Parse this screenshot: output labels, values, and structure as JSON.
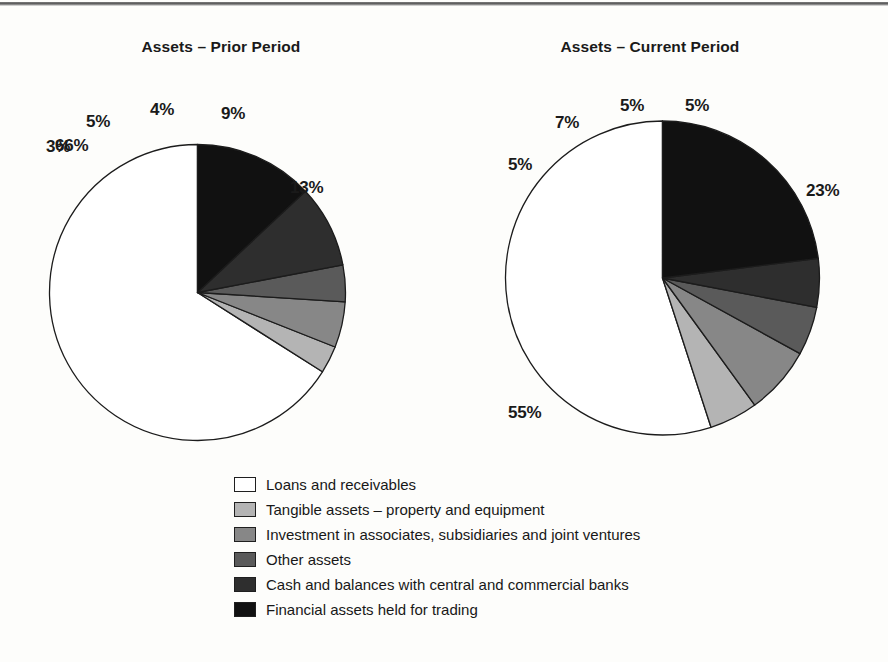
{
  "figure": {
    "background": "#fdfdfb",
    "ink": "#1a1a1a"
  },
  "charts": {
    "left": {
      "title": "Assets – Prior Period"
    },
    "right": {
      "title": "Assets – Current Period"
    }
  },
  "legend": {
    "items": [
      {
        "label": "Loans and receivables",
        "color": "#ffffff",
        "swatch_name": "legend-swatch-loans-and-receivables"
      },
      {
        "label": "Tangible assets – property and equipment",
        "color": "#b4b4b4",
        "swatch_name": "legend-swatch-tangible-assets"
      },
      {
        "label": "Investment in associates, subsidiaries and joint ventures",
        "color": "#878787",
        "swatch_name": "legend-swatch-investment-in-associates"
      },
      {
        "label": "Other assets",
        "color": "#5a5a5a",
        "swatch_name": "legend-swatch-other-assets"
      },
      {
        "label": "Cash and balances with central and commercial banks",
        "color": "#2e2e2e",
        "swatch_name": "legend-swatch-cash-and-balances"
      },
      {
        "label": "Financial assets held for trading",
        "color": "#111111",
        "swatch_name": "legend-swatch-financial-assets-held-for-trading"
      }
    ]
  },
  "chart_data": [
    {
      "type": "pie",
      "title": "Assets – Prior Period",
      "labels": [
        "Loans and receivables",
        "Tangible assets – property and equipment",
        "Investment in associates, subsidiaries and joint ventures",
        "Other assets",
        "Cash and balances with central and commercial banks",
        "Financial assets held for trading"
      ],
      "values": [
        66,
        3,
        5,
        4,
        9,
        13
      ],
      "value_labels": [
        "66%",
        "3%",
        "5%",
        "4%",
        "9%",
        "13%"
      ],
      "colors": [
        "#ffffff",
        "#b4b4b4",
        "#878787",
        "#5a5a5a",
        "#2e2e2e",
        "#111111"
      ],
      "units": "percent",
      "start_angle_deg": 0,
      "direction": "counterclockwise-from-top",
      "legend_position": "bottom-center",
      "grid": false
    },
    {
      "type": "pie",
      "title": "Assets – Current Period",
      "labels": [
        "Loans and receivables",
        "Tangible assets – property and equipment",
        "Investment in associates, subsidiaries and joint ventures",
        "Other assets",
        "Cash and balances with central and commercial banks",
        "Financial assets held for trading"
      ],
      "values": [
        55,
        5,
        7,
        5,
        5,
        23
      ],
      "value_labels": [
        "55%",
        "5%",
        "7%",
        "5%",
        "5%",
        "23%"
      ],
      "colors": [
        "#ffffff",
        "#b4b4b4",
        "#878787",
        "#5a5a5a",
        "#2e2e2e",
        "#111111"
      ],
      "units": "percent",
      "start_angle_deg": 0,
      "direction": "counterclockwise-from-top",
      "legend_position": "bottom-center",
      "grid": false
    }
  ]
}
